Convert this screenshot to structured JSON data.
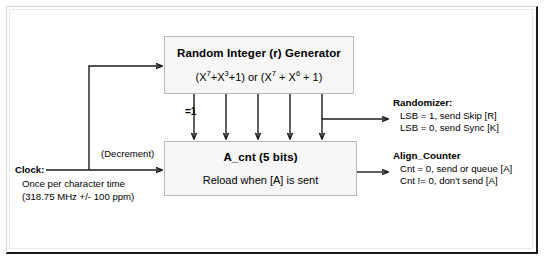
{
  "diagram": {
    "generator": {
      "title": "Random Integer (r) Generator",
      "polynomial_prefix": "(X",
      "poly": {
        "term1_base": "(X",
        "term1_exp": "7",
        "term2_base": "+X",
        "term2_exp": "3",
        "term2_tail": "+1) or (X",
        "term3_exp": "7",
        "term4_base": " + X",
        "term4_exp": "6",
        "tail": " + 1)"
      },
      "polynomial_text": "(X7+X3+1) or (X7 + X6 + 1)"
    },
    "counter": {
      "title": "A_cnt (5 bits)",
      "subtitle": "Reload when [A] is sent"
    },
    "xor_label": "=1",
    "decrement_label": "(Decrement)",
    "clock": {
      "label": "Clock:",
      "line1": "Once per character time",
      "line2": "(318.75 MHz +/- 100 ppm)"
    },
    "randomizer": {
      "title": "Randomizer:",
      "line1": "LSB = 1, send Skip [R]",
      "line2": "LSB = 0, send Sync [K]"
    },
    "align_counter": {
      "title": "Align_Counter",
      "line1": "Cnt = 0, send or queue [A]",
      "line2": "Cnt != 0, don't send [A]"
    },
    "colors": {
      "wire": "#1c1c1c",
      "box_fill": "#f7f7f7",
      "box_border": "#b9b9b9",
      "frame_dark": "#1a1a1a"
    }
  }
}
